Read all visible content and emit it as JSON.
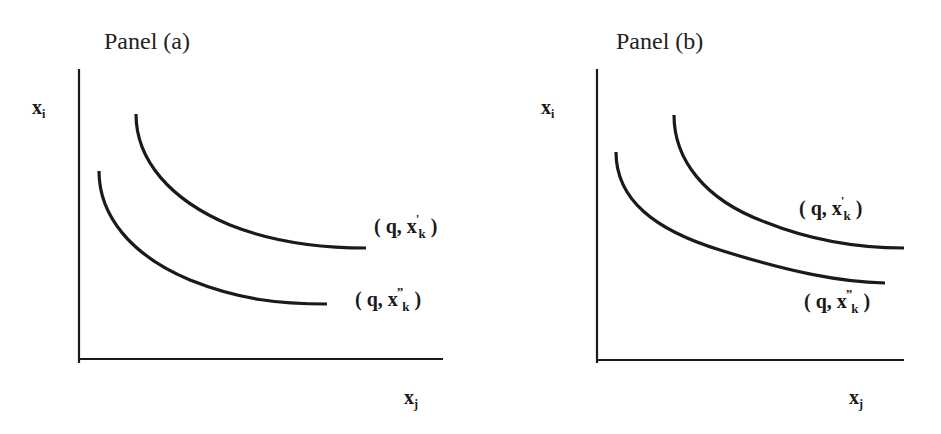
{
  "panels": [
    {
      "title": "Panel (a)",
      "y_axis_label": {
        "base": "x",
        "sub": "i"
      },
      "x_axis_label": {
        "base": "x",
        "sub": "j"
      },
      "curves": [
        {
          "label_prefix": "( q, x",
          "prime": "'",
          "sub": "k",
          "label_suffix": " )",
          "position": "upper"
        },
        {
          "label_prefix": "( q, x",
          "prime": "”",
          "sub": "k",
          "label_suffix": " )",
          "position": "lower"
        }
      ]
    },
    {
      "title": "Panel (b)",
      "y_axis_label": {
        "base": "x",
        "sub": "i"
      },
      "x_axis_label": {
        "base": "x",
        "sub": "j"
      },
      "curves": [
        {
          "label_prefix": "( q, x",
          "prime": "'",
          "sub": "k",
          "label_suffix": " )",
          "position": "upper"
        },
        {
          "label_prefix": "( q, x",
          "prime": "”",
          "sub": "k",
          "label_suffix": " )",
          "position": "lower"
        }
      ]
    }
  ],
  "colors": {
    "line": "#1a1a1a",
    "background": "#ffffff"
  }
}
